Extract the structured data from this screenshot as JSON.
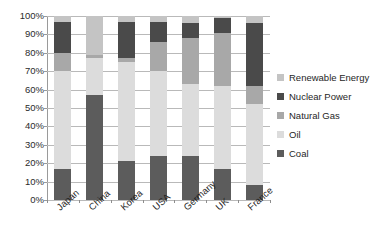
{
  "chart_data": {
    "type": "bar",
    "subtype": "100%-stacked-column",
    "title": "",
    "xlabel": "",
    "ylabel": "",
    "ylim": [
      0,
      100
    ],
    "ytick_labels": [
      "100%",
      "90%",
      "80%",
      "70%",
      "60%",
      "50%",
      "40%",
      "30%",
      "20%",
      "10%",
      "0%"
    ],
    "ytick_values": [
      100,
      90,
      80,
      70,
      60,
      50,
      40,
      30,
      20,
      10,
      0
    ],
    "grid": true,
    "legend_position": "right",
    "categories": [
      "Japan",
      "China",
      "Korea",
      "USA",
      "Germany",
      "UK",
      "France"
    ],
    "series": [
      {
        "name": "Coal",
        "color": "#5c5c5c",
        "values": [
          17,
          57,
          21,
          24,
          24,
          17,
          8
        ]
      },
      {
        "name": "Oil",
        "color": "#dcdcdc",
        "values": [
          53,
          20,
          54,
          46,
          39,
          45,
          44
        ]
      },
      {
        "name": "Natural Gas",
        "color": "#a8a8a8",
        "values": [
          10,
          2,
          2,
          16,
          25,
          29,
          10
        ]
      },
      {
        "name": "Nuclear Power",
        "color": "#4a4a4a",
        "values": [
          17,
          0,
          20,
          11,
          8,
          8,
          34
        ]
      },
      {
        "name": "Renewable Energy",
        "color": "#c4c4c4",
        "values": [
          3,
          21,
          3,
          3,
          4,
          1,
          4
        ]
      }
    ],
    "legend_entries": [
      {
        "label": "Renewable Energy",
        "color": "#c4c4c4"
      },
      {
        "label": "Nuclear Power",
        "color": "#4a4a4a"
      },
      {
        "label": "Natural Gas",
        "color": "#a8a8a8"
      },
      {
        "label": "Oil",
        "color": "#dcdcdc"
      },
      {
        "label": "Coal",
        "color": "#5c5c5c"
      }
    ]
  }
}
